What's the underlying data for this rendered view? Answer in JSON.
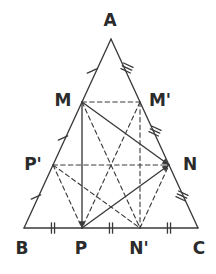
{
  "figure": {
    "kind": "geometry-diagram",
    "canvas": {
      "width": 216,
      "height": 274
    },
    "stroke_color": "#3a3a3a",
    "label_color": "#2b2b2b",
    "background": "#ffffff",
    "points": {
      "A": {
        "label": "A",
        "x": 111,
        "y": 39,
        "label_x": 110,
        "label_y": 20
      },
      "B": {
        "label": "B",
        "x": 24,
        "y": 228,
        "label_x": 22,
        "label_y": 248
      },
      "C": {
        "label": "C",
        "x": 198,
        "y": 228,
        "label_x": 199,
        "label_y": 248
      },
      "M": {
        "label": "M",
        "x": 82,
        "y": 102,
        "label_x": 63,
        "label_y": 100
      },
      "Mp": {
        "label": "M'",
        "x": 140,
        "y": 102,
        "label_x": 160,
        "label_y": 100
      },
      "N": {
        "label": "N",
        "x": 169,
        "y": 165,
        "label_x": 190,
        "label_y": 164
      },
      "Np": {
        "label": "N'",
        "x": 140,
        "y": 228,
        "label_x": 139,
        "label_y": 248
      },
      "P": {
        "label": "P",
        "x": 82,
        "y": 228,
        "label_x": 81,
        "label_y": 248
      },
      "Pp": {
        "label": "P'",
        "x": 53,
        "y": 165,
        "label_x": 33,
        "label_y": 164
      }
    },
    "solid_segments": [
      {
        "name": "side-AB",
        "from": "A",
        "to": "B"
      },
      {
        "name": "side-AC",
        "from": "A",
        "to": "C"
      },
      {
        "name": "side-BC",
        "from": "B",
        "to": "C"
      },
      {
        "name": "segment-MP",
        "from": "M",
        "to": "P",
        "arrow_end": true
      },
      {
        "name": "segment-MN",
        "from": "M",
        "to": "N",
        "arrow_end": true
      },
      {
        "name": "segment-PN",
        "from": "P",
        "to": "N",
        "arrow_end": true
      }
    ],
    "dashed_segments": [
      {
        "name": "segment-M-Mprime",
        "from": "M",
        "to": "Mp"
      },
      {
        "name": "segment-Pprime-N",
        "from": "Pp",
        "to": "N"
      },
      {
        "name": "segment-M-Nprime",
        "from": "M",
        "to": "Np"
      },
      {
        "name": "segment-Mprime-P",
        "from": "Mp",
        "to": "P"
      },
      {
        "name": "segment-Mprime-Nprime",
        "from": "Mp",
        "to": "Np"
      },
      {
        "name": "segment-Pprime-P",
        "from": "Pp",
        "to": "P"
      },
      {
        "name": "segment-Pprime-Nprime",
        "from": "Pp",
        "to": "Np"
      },
      {
        "name": "segment-Nprime-N",
        "from": "Np",
        "to": "N"
      }
    ],
    "tick_marks": [
      {
        "name": "tick-A-M",
        "x": 92,
        "y": 71,
        "count": 1,
        "angle": 65
      },
      {
        "name": "tick-M-Pprime",
        "x": 63,
        "y": 138,
        "count": 1,
        "angle": 65
      },
      {
        "name": "tick-Pprime-B",
        "x": 36,
        "y": 197,
        "count": 1,
        "angle": 65
      },
      {
        "name": "tick-A-Mprime",
        "x": 127,
        "y": 68,
        "count": 3,
        "angle": -65
      },
      {
        "name": "tick-Mprime-N",
        "x": 155,
        "y": 131,
        "count": 3,
        "angle": -65
      },
      {
        "name": "tick-N-C",
        "x": 182,
        "y": 196,
        "count": 3,
        "angle": -65
      },
      {
        "name": "tick-B-P",
        "x": 53,
        "y": 228,
        "count": 2,
        "angle": 0
      },
      {
        "name": "tick-P-Nprime",
        "x": 111,
        "y": 228,
        "count": 2,
        "angle": 0
      },
      {
        "name": "tick-Nprime-C",
        "x": 169,
        "y": 228,
        "count": 2,
        "angle": 0
      }
    ]
  }
}
